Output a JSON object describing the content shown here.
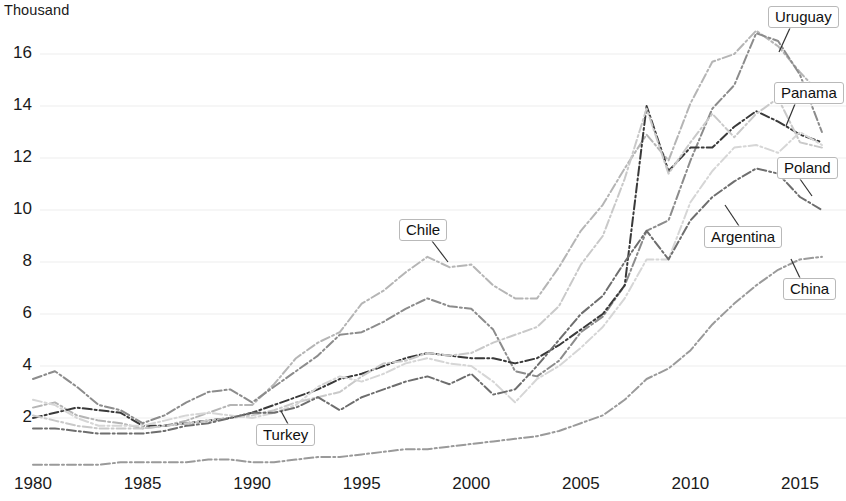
{
  "axis": {
    "unit_label": "Thousand",
    "y_ticks": [
      2,
      4,
      6,
      8,
      10,
      12,
      14,
      16
    ],
    "x_ticks": [
      1980,
      1985,
      1990,
      1995,
      2000,
      2005,
      2010,
      2015
    ]
  },
  "labels": {
    "chile": "Chile",
    "turkey": "Turkey",
    "uruguay": "Uruguay",
    "panama": "Panama",
    "poland": "Poland",
    "argentina": "Argentina",
    "china": "China"
  },
  "chart_data": {
    "type": "line",
    "title": "",
    "subtitle": "",
    "xlabel": "",
    "ylabel": "Thousand",
    "xlim": [
      1980,
      2016
    ],
    "ylim": [
      0,
      17.2
    ],
    "grid": true,
    "legend_position": "inline-callout-labels",
    "x": [
      1980,
      1981,
      1982,
      1983,
      1984,
      1985,
      1986,
      1987,
      1988,
      1989,
      1990,
      1991,
      1992,
      1993,
      1994,
      1995,
      1996,
      1997,
      1998,
      1999,
      2000,
      2001,
      2002,
      2003,
      2004,
      2005,
      2006,
      2007,
      2008,
      2009,
      2010,
      2011,
      2012,
      2013,
      2014,
      2015,
      2016
    ],
    "series": [
      {
        "name": "Chile",
        "color": "#b5b5b5",
        "dash": "dashdot",
        "values": [
          2.4,
          2.6,
          2.1,
          1.9,
          1.8,
          1.6,
          1.7,
          1.9,
          2.2,
          2.5,
          2.5,
          3.3,
          4.3,
          4.9,
          5.3,
          6.4,
          6.9,
          7.6,
          8.2,
          7.8,
          7.9,
          7.1,
          6.6,
          6.6,
          7.8,
          9.2,
          10.2,
          11.6,
          12.9,
          11.9,
          14.1,
          15.7,
          16.0,
          16.9,
          16.3,
          15.3,
          14.4
        ]
      },
      {
        "name": "Uruguay",
        "color": "#8c8c8c",
        "dash": "dashdot",
        "values": [
          3.5,
          3.8,
          3.2,
          2.5,
          2.3,
          1.8,
          2.1,
          2.6,
          3.0,
          3.1,
          2.6,
          3.2,
          3.8,
          4.4,
          5.2,
          5.3,
          5.7,
          6.2,
          6.6,
          6.3,
          6.2,
          5.4,
          3.8,
          3.6,
          4.2,
          5.3,
          5.9,
          7.1,
          9.2,
          9.6,
          11.9,
          13.9,
          14.8,
          16.8,
          16.5,
          15.2,
          13.0
        ]
      },
      {
        "name": "Panama",
        "color": "#3a3a3a",
        "dash": "dashdot",
        "values": [
          2.0,
          2.2,
          2.4,
          2.3,
          2.2,
          1.7,
          1.7,
          1.8,
          1.9,
          2.0,
          2.2,
          2.5,
          2.8,
          3.1,
          3.5,
          3.7,
          4.0,
          4.3,
          4.5,
          4.4,
          4.3,
          4.3,
          4.1,
          4.3,
          4.8,
          5.4,
          6.0,
          7.1,
          14.0,
          11.5,
          12.4,
          12.4,
          13.2,
          13.8,
          13.4,
          12.9,
          12.6
        ]
      },
      {
        "name": "Poland",
        "color": "#c9c9c9",
        "dash": "dashdot",
        "values": [
          2.1,
          1.9,
          1.7,
          1.6,
          1.6,
          1.6,
          1.7,
          1.8,
          1.9,
          2.0,
          2.1,
          2.3,
          2.6,
          2.8,
          3.0,
          3.6,
          4.1,
          4.2,
          4.5,
          4.4,
          4.5,
          4.9,
          5.2,
          5.5,
          6.3,
          7.9,
          9.0,
          11.2,
          13.9,
          11.4,
          12.6,
          13.7,
          12.8,
          13.7,
          14.3,
          12.6,
          12.4
        ]
      },
      {
        "name": "Argentina",
        "color": "#d6d6d6",
        "dash": "dashdot",
        "values": [
          2.7,
          2.5,
          2.0,
          1.7,
          1.7,
          1.7,
          1.9,
          2.1,
          2.2,
          2.1,
          2.0,
          2.2,
          2.5,
          3.2,
          3.6,
          3.4,
          3.7,
          4.1,
          4.3,
          4.1,
          4.0,
          3.4,
          2.6,
          3.5,
          4.0,
          4.7,
          5.5,
          6.6,
          8.1,
          8.1,
          10.3,
          11.5,
          12.4,
          12.5,
          12.2,
          13.0,
          12.5
        ]
      },
      {
        "name": "Turkey",
        "color": "#6e6e6e",
        "dash": "dashdot",
        "values": [
          1.6,
          1.6,
          1.5,
          1.4,
          1.4,
          1.4,
          1.5,
          1.7,
          1.8,
          2.0,
          2.2,
          2.2,
          2.4,
          2.8,
          2.3,
          2.8,
          3.1,
          3.4,
          3.6,
          3.3,
          3.7,
          2.9,
          3.1,
          4.0,
          5.0,
          6.0,
          6.7,
          8.0,
          9.2,
          8.1,
          9.6,
          10.5,
          11.1,
          11.6,
          11.4,
          10.5,
          10.0
        ]
      },
      {
        "name": "China",
        "color": "#9a9a9a",
        "dash": "dashdot",
        "values": [
          0.2,
          0.2,
          0.2,
          0.2,
          0.3,
          0.3,
          0.3,
          0.3,
          0.4,
          0.4,
          0.3,
          0.3,
          0.4,
          0.5,
          0.5,
          0.6,
          0.7,
          0.8,
          0.8,
          0.9,
          1.0,
          1.1,
          1.2,
          1.3,
          1.5,
          1.8,
          2.1,
          2.7,
          3.5,
          3.9,
          4.6,
          5.6,
          6.4,
          7.1,
          7.7,
          8.1,
          8.2
        ]
      }
    ]
  },
  "callouts": [
    {
      "key": "chile",
      "label_x": 399,
      "label_y": 219,
      "leader": [
        [
          432,
          241
        ],
        [
          448,
          262
        ]
      ]
    },
    {
      "key": "turkey",
      "label_x": 256,
      "label_y": 424,
      "leader": [
        [
          288,
          424
        ],
        [
          281,
          411
        ]
      ]
    },
    {
      "key": "uruguay",
      "label_x": 768,
      "label_y": 6,
      "leader": [
        [
          790,
          28
        ],
        [
          779,
          52
        ]
      ]
    },
    {
      "key": "panama",
      "label_x": 774,
      "label_y": 82,
      "leader": [
        [
          795,
          104
        ],
        [
          786,
          126
        ]
      ]
    },
    {
      "key": "poland",
      "label_x": 777,
      "label_y": 157,
      "leader": [
        [
          800,
          179
        ],
        [
          812,
          196
        ]
      ]
    },
    {
      "key": "argentina",
      "label_x": 704,
      "label_y": 226,
      "leader": [
        [
          739,
          226
        ],
        [
          725,
          205
        ]
      ]
    },
    {
      "key": "china",
      "label_x": 783,
      "label_y": 278,
      "leader": [
        [
          800,
          278
        ],
        [
          791,
          259
        ]
      ]
    }
  ]
}
